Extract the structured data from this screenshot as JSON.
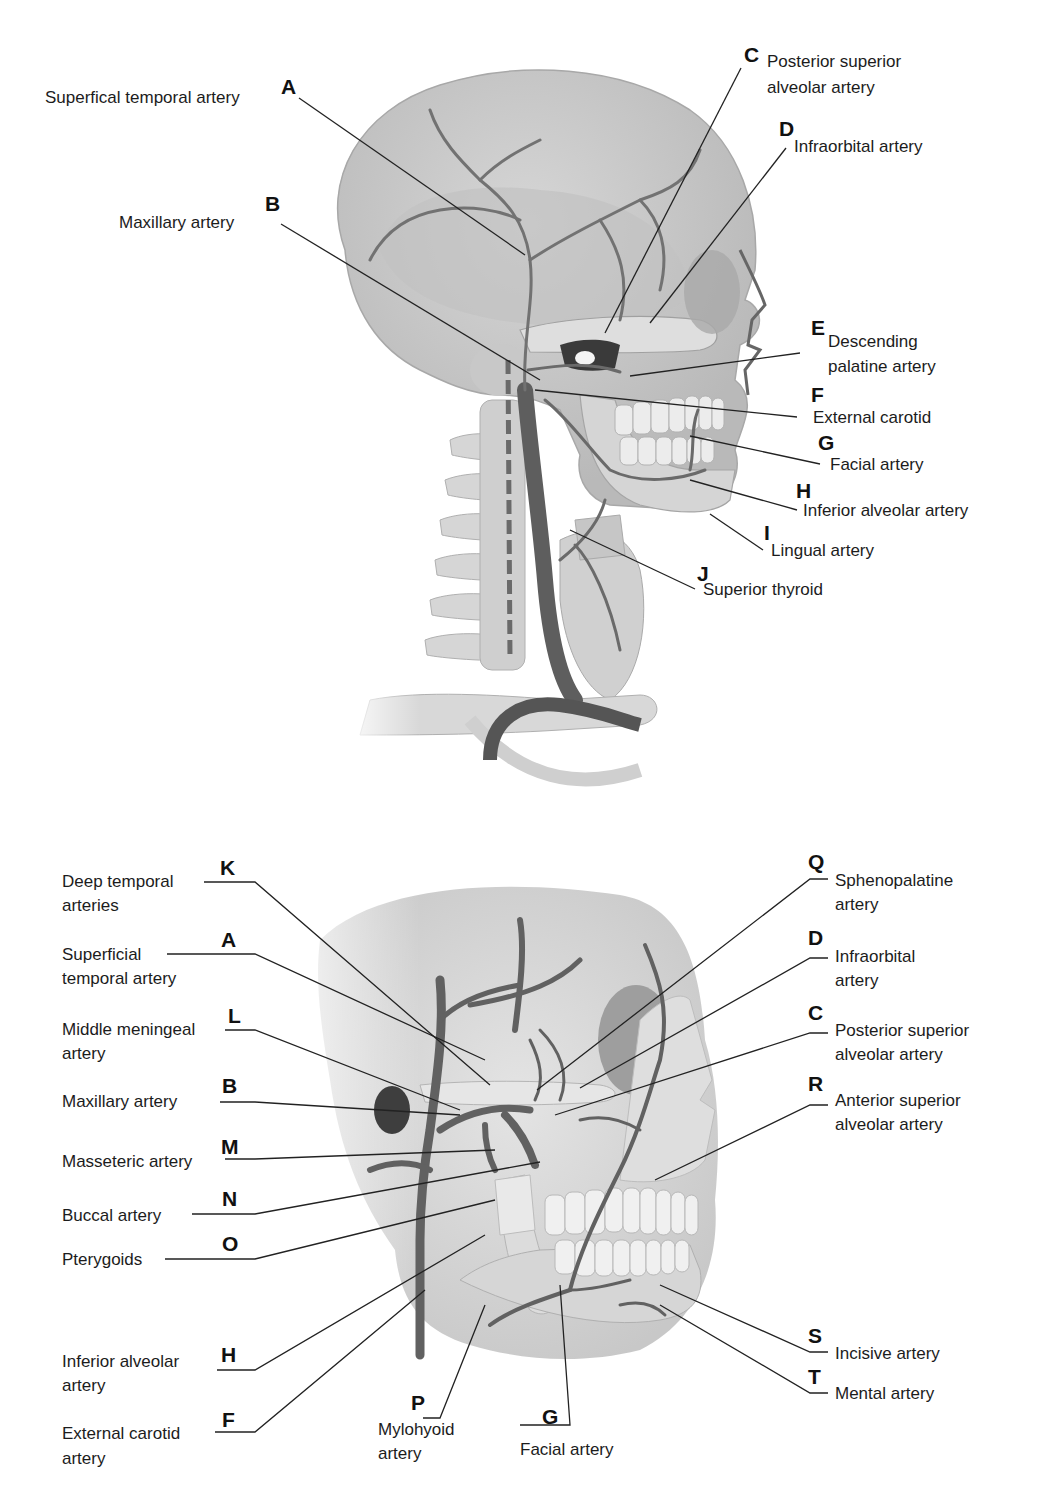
{
  "figure_top": {
    "title": "Lateral view of head and neck arteries",
    "labels": [
      {
        "letter": "A",
        "text": "Superfical temporal artery"
      },
      {
        "letter": "B",
        "text": "Maxillary artery"
      },
      {
        "letter": "C",
        "text_line1": "Posterior superior",
        "text_line2": "alveolar artery"
      },
      {
        "letter": "D",
        "text": "Infraorbital artery"
      },
      {
        "letter": "E",
        "text_line1": "Descending",
        "text_line2": "palatine artery"
      },
      {
        "letter": "F",
        "text": "External carotid"
      },
      {
        "letter": "G",
        "text": "Facial artery"
      },
      {
        "letter": "H",
        "text": "Inferior alveolar artery"
      },
      {
        "letter": "I",
        "text": "Lingual artery"
      },
      {
        "letter": "J",
        "text": "Superior thyroid"
      }
    ]
  },
  "figure_bottom": {
    "title": "Oblique view of facial arteries",
    "labels": [
      {
        "letter": "K",
        "text_line1": "Deep temporal",
        "text_line2": "arteries"
      },
      {
        "letter": "A",
        "text_line1": "Superficial",
        "text_line2": "temporal artery"
      },
      {
        "letter": "L",
        "text_line1": "Middle meningeal",
        "text_line2": "artery"
      },
      {
        "letter": "B",
        "text": "Maxillary artery"
      },
      {
        "letter": "M",
        "text": "Masseteric artery"
      },
      {
        "letter": "N",
        "text": "Buccal artery"
      },
      {
        "letter": "O",
        "text": "Pterygoids"
      },
      {
        "letter": "H",
        "text_line1": "Inferior alveolar",
        "text_line2": "artery"
      },
      {
        "letter": "F",
        "text_line1": "External carotid",
        "text_line2": "artery"
      },
      {
        "letter": "P",
        "text_line1": "Mylohyoid",
        "text_line2": "artery"
      },
      {
        "letter": "G",
        "text": "Facial artery"
      },
      {
        "letter": "Q",
        "text_line1": "Sphenopalatine",
        "text_line2": "artery"
      },
      {
        "letter": "D",
        "text_line1": "Infraorbital",
        "text_line2": "artery"
      },
      {
        "letter": "C",
        "text_line1": "Posterior superior",
        "text_line2": "alveolar artery"
      },
      {
        "letter": "R",
        "text_line1": "Anterior superior",
        "text_line2": "alveolar artery"
      },
      {
        "letter": "S",
        "text": "Incisive artery"
      },
      {
        "letter": "T",
        "text": "Mental artery"
      }
    ]
  },
  "colors": {
    "bone": "#d9d9d9",
    "bone_shadow": "#bdbdbd",
    "artery": "#6e6e6e",
    "leader_line": "#222222"
  }
}
